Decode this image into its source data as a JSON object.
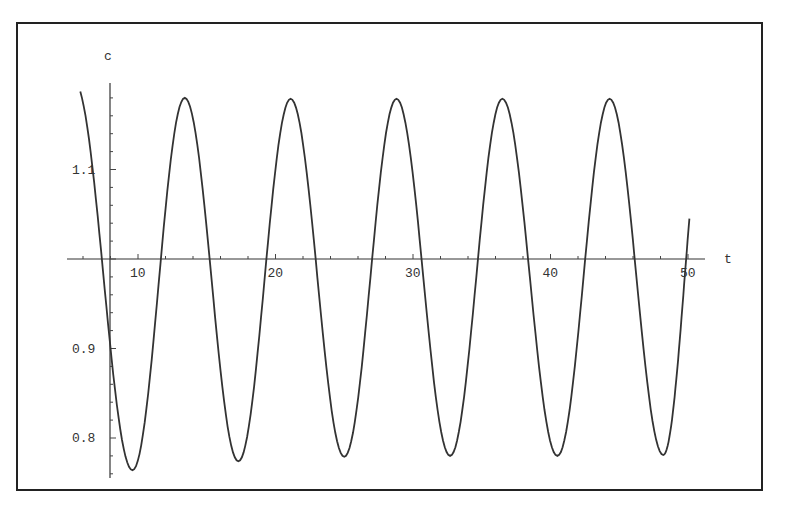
{
  "chart_data": {
    "type": "line",
    "title": "",
    "xlabel": "t",
    "ylabel": "c",
    "xlim": [
      5.8,
      51.2
    ],
    "ylim": [
      0.76,
      1.2
    ],
    "axis_origin": {
      "t": 8.9,
      "c": 1.0
    },
    "grid": false,
    "legend": null,
    "x_ticks": [
      10,
      20,
      30,
      40,
      50
    ],
    "x_tick_labels": [
      "10",
      "20",
      "30",
      "40",
      "50"
    ],
    "y_ticks": [
      0.8,
      0.9,
      1.1
    ],
    "y_tick_labels": [
      "0.8",
      "0.9",
      "1.1"
    ],
    "series": [
      {
        "name": "c(t)",
        "color": "#333333",
        "points": [
          [
            5.8,
            1.187
          ],
          [
            9.6,
            0.764
          ],
          [
            13.4,
            1.18
          ],
          [
            17.3,
            0.774
          ],
          [
            21.1,
            1.179
          ],
          [
            25.0,
            0.779
          ],
          [
            28.8,
            1.179
          ],
          [
            32.7,
            0.78
          ],
          [
            36.5,
            1.179
          ],
          [
            40.5,
            0.78
          ],
          [
            44.3,
            1.179
          ],
          [
            48.2,
            0.781
          ],
          [
            50.1,
            1.045
          ]
        ]
      }
    ]
  }
}
